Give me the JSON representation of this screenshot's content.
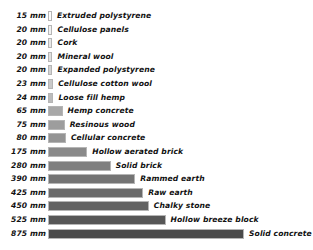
{
  "chart_data": {
    "type": "bar",
    "orientation": "horizontal",
    "title": "",
    "subtitle": "",
    "xlabel": "",
    "ylabel": "",
    "unit": "mm",
    "grid": false,
    "legend": false,
    "axis_visible": false,
    "xlim": [
      0,
      875
    ],
    "categories": [
      "Extruded polystyrene",
      "Cellulose panels",
      "Cork",
      "Mineral wool",
      "Expanded polystyrene",
      "Cellulose cotton wool",
      "Loose fill hemp",
      "Hemp concrete",
      "Resinous wood",
      "Cellular concrete",
      "Hollow aerated brick",
      "Solid brick",
      "Rammed earth",
      "Raw earth",
      "Chalky stone",
      "Hollow breeze block",
      "Solid concrete"
    ],
    "values": [
      15,
      20,
      20,
      20,
      20,
      23,
      24,
      65,
      75,
      80,
      175,
      280,
      390,
      425,
      450,
      525,
      875
    ],
    "value_labels": [
      "15 mm",
      "20 mm",
      "20 mm",
      "20 mm",
      "20 mm",
      "23 mm",
      "24 mm",
      "65 mm",
      "75 mm",
      "80 mm",
      "175 mm",
      "280 mm",
      "390 mm",
      "425 mm",
      "450 mm",
      "525 mm",
      "875 mm"
    ],
    "bar_colors": [
      "#fdfdfd",
      "#f2f2f2",
      "#e8e8e8",
      "#e0e0e0",
      "#d4d4d4",
      "#c9c9c9",
      "#bcbcbc",
      "#a8a8a8",
      "#9d9d9d",
      "#949494",
      "#8a8a8a",
      "#7f7f7f",
      "#747474",
      "#6b6b6b",
      "#636363",
      "#565656",
      "#4a4a4a"
    ],
    "bar_border_color": "#b5b5b5",
    "text_color": "#111111",
    "background": "#ffffff"
  }
}
